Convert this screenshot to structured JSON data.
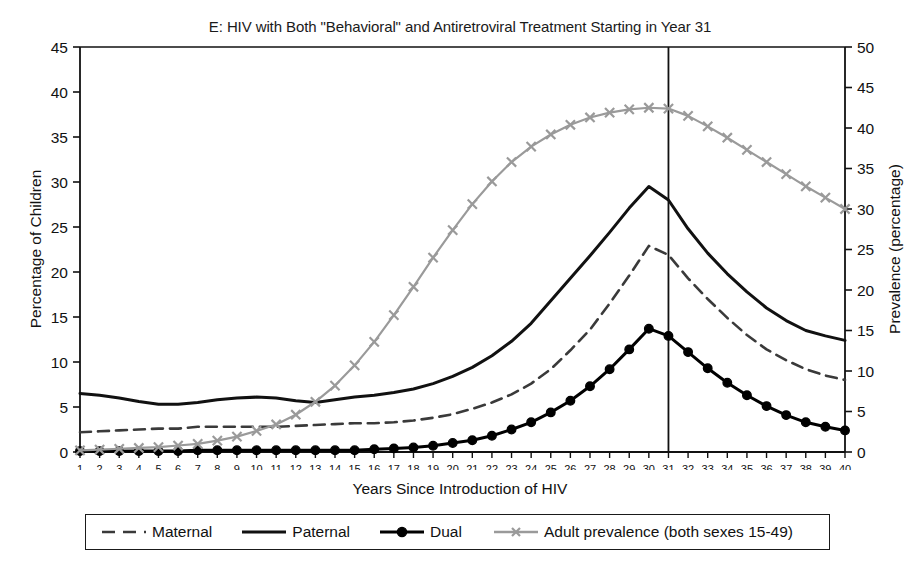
{
  "chart_data": {
    "type": "line",
    "title": "E: HIV with Both \"Behavioral\" and Antiretroviral Treatment Starting in Year 31",
    "xlabel": "Years Since Introduction of HIV",
    "ylabel": "Percentage of Children",
    "ylabel_right": "Prevalence (percentage)",
    "xlim": [
      1,
      40
    ],
    "ylim": [
      0,
      45
    ],
    "ylim_right": [
      0,
      50
    ],
    "yticks": [
      0,
      5,
      10,
      15,
      20,
      25,
      30,
      35,
      40,
      45
    ],
    "yticks_right": [
      0,
      5,
      10,
      15,
      20,
      25,
      30,
      35,
      40,
      45,
      50
    ],
    "grid": false,
    "legend_position": "bottom",
    "x": [
      1,
      2,
      3,
      4,
      5,
      6,
      7,
      8,
      9,
      10,
      11,
      12,
      13,
      14,
      15,
      16,
      17,
      18,
      19,
      20,
      21,
      22,
      23,
      24,
      25,
      26,
      27,
      28,
      29,
      30,
      31,
      32,
      33,
      34,
      35,
      36,
      37,
      38,
      39,
      40
    ],
    "categories": [
      "1",
      "2",
      "3",
      "4",
      "5",
      "6",
      "7",
      "8",
      "9",
      "10",
      "11",
      "12",
      "13",
      "14",
      "15",
      "16",
      "17",
      "18",
      "19",
      "20",
      "21",
      "22",
      "23",
      "24",
      "25",
      "26",
      "27",
      "28",
      "29",
      "30",
      "31",
      "32",
      "33",
      "34",
      "35",
      "36",
      "37",
      "38",
      "39",
      "40"
    ],
    "annotations": [
      {
        "type": "vline",
        "x": 31,
        "label": "Treatment start Year 31"
      }
    ],
    "series": [
      {
        "name": "Maternal",
        "axis": "left",
        "style": "dashed",
        "color": "#3a3a3a",
        "marker": "none",
        "values": [
          2.2,
          2.3,
          2.4,
          2.5,
          2.6,
          2.6,
          2.8,
          2.8,
          2.8,
          2.8,
          2.8,
          2.9,
          3.0,
          3.1,
          3.2,
          3.2,
          3.3,
          3.5,
          3.8,
          4.2,
          4.8,
          5.5,
          6.4,
          7.6,
          9.2,
          11.3,
          13.6,
          16.5,
          19.6,
          22.9,
          21.9,
          19.3,
          17.0,
          14.9,
          13.0,
          11.4,
          10.2,
          9.2,
          8.5,
          8.0
        ]
      },
      {
        "name": "Paternal",
        "axis": "left",
        "style": "solid",
        "color": "#111111",
        "marker": "none",
        "values": [
          6.5,
          6.3,
          6.0,
          5.6,
          5.3,
          5.3,
          5.5,
          5.8,
          6.0,
          6.1,
          6.0,
          5.7,
          5.5,
          5.8,
          6.1,
          6.3,
          6.6,
          7.0,
          7.6,
          8.4,
          9.4,
          10.7,
          12.3,
          14.3,
          16.8,
          19.3,
          21.8,
          24.4,
          27.1,
          29.5,
          28.0,
          24.8,
          22.1,
          19.8,
          17.8,
          16.0,
          14.6,
          13.5,
          12.9,
          12.4
        ]
      },
      {
        "name": "Dual",
        "axis": "left",
        "style": "solid",
        "color": "#000000",
        "marker": "circle",
        "values": [
          0.1,
          0.1,
          0.1,
          0.1,
          0.1,
          0.1,
          0.2,
          0.2,
          0.2,
          0.2,
          0.2,
          0.2,
          0.2,
          0.2,
          0.2,
          0.3,
          0.4,
          0.5,
          0.7,
          1.0,
          1.3,
          1.8,
          2.5,
          3.3,
          4.4,
          5.7,
          7.3,
          9.2,
          11.4,
          13.7,
          12.9,
          11.1,
          9.3,
          7.7,
          6.3,
          5.1,
          4.1,
          3.3,
          2.8,
          2.4
        ]
      },
      {
        "name": "Adult prevalence (both sexes 15-49)",
        "axis": "right",
        "style": "solid",
        "color": "#9a9a9a",
        "marker": "x",
        "values": [
          0.2,
          0.3,
          0.4,
          0.5,
          0.6,
          0.8,
          1.0,
          1.4,
          1.9,
          2.6,
          3.4,
          4.6,
          6.2,
          8.2,
          10.7,
          13.6,
          16.9,
          20.4,
          24.0,
          27.4,
          30.6,
          33.4,
          35.8,
          37.7,
          39.2,
          40.4,
          41.3,
          41.9,
          42.3,
          42.5,
          42.4,
          41.5,
          40.2,
          38.8,
          37.3,
          35.8,
          34.3,
          32.8,
          31.4,
          30.0
        ]
      }
    ]
  },
  "legend": {
    "entries": [
      {
        "label": "Maternal",
        "swatch": "dashed-line"
      },
      {
        "label": "Paternal",
        "swatch": "solid-line"
      },
      {
        "label": "Dual",
        "swatch": "solid-line-circle-marker"
      },
      {
        "label": "Adult prevalence (both sexes 15-49)",
        "swatch": "gray-x-marker-line"
      }
    ]
  }
}
